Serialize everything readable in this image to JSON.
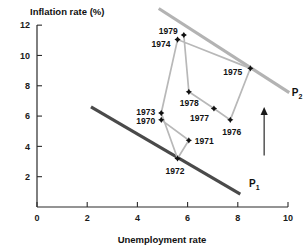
{
  "chart_data": {
    "type": "scatter",
    "title": "",
    "xlabel": "Unemployment rate",
    "ylabel": "Inflation rate (%)",
    "xlim": [
      0,
      10
    ],
    "ylim": [
      0,
      13
    ],
    "grid": false,
    "legend": "none",
    "xticks": [
      "0",
      "2",
      "4",
      "6",
      "8",
      "10"
    ],
    "xtick_values": [
      0,
      2,
      4,
      6,
      8,
      10
    ],
    "yticks": [
      "2",
      "4",
      "6",
      "8",
      "10",
      "12"
    ],
    "ytick_values": [
      2,
      4,
      6,
      8,
      10,
      12
    ],
    "points": [
      {
        "label": "1970",
        "x": 4.95,
        "y": 5.75
      },
      {
        "label": "1971",
        "x": 6.05,
        "y": 4.4
      },
      {
        "label": "1972",
        "x": 5.6,
        "y": 3.2
      },
      {
        "label": "1973",
        "x": 4.95,
        "y": 6.2
      },
      {
        "label": "1974",
        "x": 5.6,
        "y": 11.05
      },
      {
        "label": "1975",
        "x": 8.5,
        "y": 9.15
      },
      {
        "label": "1976",
        "x": 7.7,
        "y": 5.75
      },
      {
        "label": "1977",
        "x": 7.05,
        "y": 6.5
      },
      {
        "label": "1978",
        "x": 6.05,
        "y": 7.6
      },
      {
        "label": "1979",
        "x": 5.85,
        "y": 11.35
      }
    ],
    "point_order": [
      "1970",
      "1971",
      "1972",
      "1973",
      "1974",
      "1975",
      "1976",
      "1977",
      "1978",
      "1979"
    ],
    "label_offsets": [
      {
        "label": "1970",
        "dx": -25,
        "dy": 4
      },
      {
        "label": "1971",
        "dx": 6,
        "dy": 4
      },
      {
        "label": "1972",
        "dx": -12,
        "dy": 15
      },
      {
        "label": "1973",
        "dx": -25,
        "dy": 2
      },
      {
        "label": "1974",
        "dx": -26,
        "dy": 7
      },
      {
        "label": "1975",
        "dx": -27,
        "dy": 7
      },
      {
        "label": "1976",
        "dx": -8,
        "dy": 15
      },
      {
        "label": "1977",
        "dx": -24,
        "dy": 12
      },
      {
        "label": "1978",
        "dx": -9,
        "dy": 14
      },
      {
        "label": "1979",
        "dx": -25,
        "dy": -1
      }
    ],
    "curves": [
      {
        "name": "P1",
        "label": "P",
        "subscript": "1",
        "color": "#4a4a4a",
        "x1": 2.15,
        "y1": 6.6,
        "x2": 8.1,
        "y2": 0.85,
        "label_x": 8.45,
        "label_y": 1.3
      },
      {
        "name": "P2",
        "label": "P",
        "subscript": "2",
        "color": "#b3b3b3",
        "x1": 4.85,
        "y1": 13.1,
        "x2": 10.05,
        "y2": 7.55,
        "label_x": 10.15,
        "label_y": 7.3
      }
    ],
    "annotations": [
      {
        "name": "upward-shift-arrow",
        "type": "arrow",
        "direction": "up",
        "x": 9.05,
        "y_start": 3.4,
        "y_end": 6.6
      }
    ]
  },
  "chart": {
    "y_axis_title": "Inflation rate (%)",
    "x_axis_title": "Unemployment rate"
  }
}
